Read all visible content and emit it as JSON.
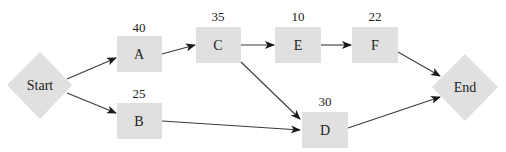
{
  "diagram": {
    "type": "activity-network",
    "colors": {
      "node_fill": "#e0e0e0",
      "edge": "#3a3a3a",
      "text": "#222222",
      "background": "#ffffff"
    },
    "nodes": {
      "start": {
        "label": "Start",
        "shape": "diamond"
      },
      "a": {
        "label": "A",
        "duration": "40",
        "shape": "box"
      },
      "b": {
        "label": "B",
        "duration": "25",
        "shape": "box"
      },
      "c": {
        "label": "C",
        "duration": "35",
        "shape": "box"
      },
      "d": {
        "label": "D",
        "duration": "30",
        "shape": "box"
      },
      "e": {
        "label": "E",
        "duration": "10",
        "shape": "box"
      },
      "f": {
        "label": "F",
        "duration": "22",
        "shape": "box"
      },
      "end": {
        "label": "End",
        "shape": "diamond"
      }
    },
    "edges": [
      {
        "from": "Start",
        "to": "A"
      },
      {
        "from": "Start",
        "to": "B"
      },
      {
        "from": "A",
        "to": "C"
      },
      {
        "from": "C",
        "to": "E"
      },
      {
        "from": "C",
        "to": "D"
      },
      {
        "from": "E",
        "to": "F"
      },
      {
        "from": "B",
        "to": "D"
      },
      {
        "from": "F",
        "to": "End"
      },
      {
        "from": "D",
        "to": "End"
      }
    ]
  }
}
